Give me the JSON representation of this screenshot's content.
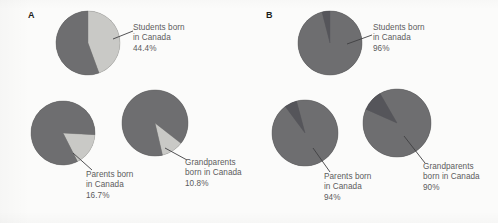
{
  "figure": {
    "background_color": "#fbfbfa",
    "text_color": "#5b5b5d",
    "panel_label_color": "#1d1d1b"
  },
  "panels": [
    {
      "id": "A",
      "label": "A"
    },
    {
      "id": "B",
      "label": "B"
    }
  ],
  "colors": {
    "major_slice": "#6e6e70",
    "minor_slice_light": "#c9c9c6",
    "minor_slice_dark": "#55555a",
    "leader_line": "#3f3f42"
  },
  "callouts": {
    "a_students": {
      "line1": "Students born",
      "line2": "in Canada",
      "value": "44.4%"
    },
    "a_parents": {
      "line1": "Parents born",
      "line2": "in Canada",
      "value": "16.7%"
    },
    "a_grandparents": {
      "line1": "Grandparents",
      "line2": "born in Canada",
      "value": "10.8%"
    },
    "b_students": {
      "line1": "Students born",
      "line2": "in Canada",
      "value": "96%"
    },
    "b_parents": {
      "line1": "Parents born",
      "line2": "in Canada",
      "value": "94%"
    },
    "b_grandparents": {
      "line1": "Grandparents",
      "line2": "born in Canada",
      "value": "90%"
    }
  },
  "chart_data": [
    {
      "type": "pie",
      "id": "A-students",
      "panel": "A",
      "title": "Students born in Canada",
      "categories": [
        "Born in Canada",
        "Not born in Canada"
      ],
      "values": [
        44.4,
        55.6
      ],
      "units": "percent",
      "highlight_category": "Born in Canada",
      "highlight_value": 44.4,
      "data_label": "44.4%",
      "start_angle_deg": 0,
      "center": [
        88,
        43
      ],
      "radius": 32,
      "colors": [
        "#c9c9c6",
        "#6e6e70"
      ],
      "legend": "none",
      "grid": false
    },
    {
      "type": "pie",
      "id": "A-parents",
      "panel": "A",
      "title": "Parents born in Canada",
      "categories": [
        "Born in Canada",
        "Not born in Canada"
      ],
      "values": [
        16.7,
        83.3
      ],
      "units": "percent",
      "highlight_category": "Born in Canada",
      "highlight_value": 16.7,
      "data_label": "16.7%",
      "start_angle_deg": 93,
      "center": [
        63,
        133
      ],
      "radius": 32,
      "colors": [
        "#c9c9c6",
        "#6e6e70"
      ],
      "legend": "none",
      "grid": false
    },
    {
      "type": "pie",
      "id": "A-grandparents",
      "panel": "A",
      "title": "Grandparents born in Canada",
      "categories": [
        "Born in Canada",
        "Not born in Canada"
      ],
      "values": [
        10.8,
        89.2
      ],
      "units": "percent",
      "highlight_category": "Born in Canada",
      "highlight_value": 10.8,
      "data_label": "10.8%",
      "start_angle_deg": 128,
      "center": [
        155,
        123
      ],
      "radius": 33,
      "colors": [
        "#c9c9c6",
        "#6e6e70"
      ],
      "legend": "none",
      "grid": false
    },
    {
      "type": "pie",
      "id": "B-students",
      "panel": "B",
      "title": "Students born in Canada",
      "categories": [
        "Born in Canada",
        "Not born in Canada"
      ],
      "values": [
        96,
        4
      ],
      "units": "percent",
      "highlight_category": "Born in Canada",
      "highlight_value": 96,
      "data_label": "96%",
      "start_angle_deg": 0,
      "center": [
        330,
        43
      ],
      "radius": 32,
      "colors": [
        "#6e6e70",
        "#55555a"
      ],
      "legend": "none",
      "grid": false
    },
    {
      "type": "pie",
      "id": "B-parents",
      "panel": "B",
      "title": "Parents born in Canada",
      "categories": [
        "Born in Canada",
        "Not born in Canada"
      ],
      "values": [
        94,
        6
      ],
      "units": "percent",
      "highlight_category": "Born in Canada",
      "highlight_value": 94,
      "data_label": "94%",
      "start_angle_deg": 345,
      "center": [
        305,
        133
      ],
      "radius": 33,
      "colors": [
        "#6e6e70",
        "#55555a"
      ],
      "legend": "none",
      "grid": false
    },
    {
      "type": "pie",
      "id": "B-grandparents",
      "panel": "B",
      "title": "Grandparents born in Canada",
      "categories": [
        "Born in Canada",
        "Not born in Canada"
      ],
      "values": [
        90,
        10
      ],
      "units": "percent",
      "highlight_category": "Born in Canada",
      "highlight_value": 90,
      "data_label": "90%",
      "start_angle_deg": 330,
      "center": [
        397,
        123
      ],
      "radius": 34,
      "colors": [
        "#6e6e70",
        "#55555a"
      ],
      "legend": "none",
      "grid": false
    }
  ],
  "leader_lines": [
    {
      "name": "a-students-leader",
      "x1": 113,
      "y1": 39,
      "x2": 133,
      "y2": 31
    },
    {
      "name": "a-parents-leader",
      "x1": 73,
      "y1": 153,
      "x2": 92,
      "y2": 170
    },
    {
      "name": "a-grandparents-leader",
      "x1": 165,
      "y1": 148,
      "x2": 187,
      "y2": 160
    },
    {
      "name": "b-students-leader",
      "x1": 347,
      "y1": 44,
      "x2": 372,
      "y2": 35
    },
    {
      "name": "b-parents-leader",
      "x1": 313,
      "y1": 148,
      "x2": 330,
      "y2": 172
    },
    {
      "name": "b-grandparents-leader",
      "x1": 404,
      "y1": 136,
      "x2": 425,
      "y2": 163
    }
  ]
}
